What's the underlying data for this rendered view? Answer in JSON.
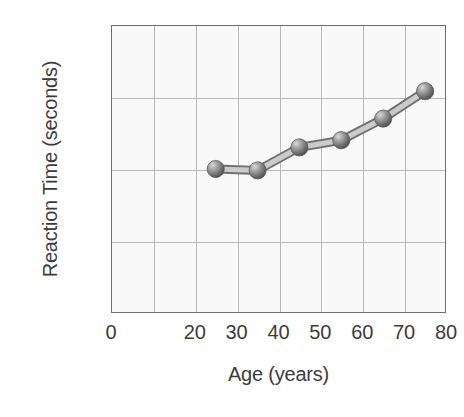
{
  "chart_data": {
    "type": "line",
    "title": "",
    "xlabel": "Age (years)",
    "ylabel": "Reaction Time (seconds)",
    "xlim": [
      0,
      80
    ],
    "ylim": [
      0,
      2.0
    ],
    "grid": true,
    "legend": "none",
    "x": [
      25,
      35,
      45,
      55,
      65,
      75
    ],
    "values": [
      1.0,
      0.99,
      1.15,
      1.2,
      1.35,
      1.54
    ],
    "series": [
      {
        "name": "Reaction Time",
        "x": [
          25,
          35,
          45,
          55,
          65,
          75
        ],
        "values": [
          1.0,
          0.99,
          1.15,
          1.2,
          1.35,
          1.54
        ],
        "marker": "sphere",
        "color": "#808080"
      }
    ],
    "xticks": [
      {
        "value": 0,
        "label": "0"
      },
      {
        "value": 10,
        "label": ""
      },
      {
        "value": 20,
        "label": "20"
      },
      {
        "value": 30,
        "label": "30"
      },
      {
        "value": 40,
        "label": "40"
      },
      {
        "value": 50,
        "label": "50"
      },
      {
        "value": 60,
        "label": "60"
      },
      {
        "value": 70,
        "label": "70"
      },
      {
        "value": 80,
        "label": "80"
      }
    ],
    "yticks": [
      {
        "value": 0,
        "label": "0"
      },
      {
        "value": 0.5,
        "label": "0.5"
      },
      {
        "value": 1.0,
        "label": "1.0"
      },
      {
        "value": 1.5,
        "label": "1.5"
      },
      {
        "value": 2.0,
        "label": "2.0"
      }
    ],
    "colors": {
      "plot_background": "#f9f9f9",
      "frame": "#6e6e6e",
      "gridline": "#b9b9b9",
      "marker": "#808080",
      "marker_highlight": "#d8d8d8",
      "line": "#9a9a9a",
      "text": "#3c3c3c",
      "page_background": "#ffffff"
    }
  }
}
